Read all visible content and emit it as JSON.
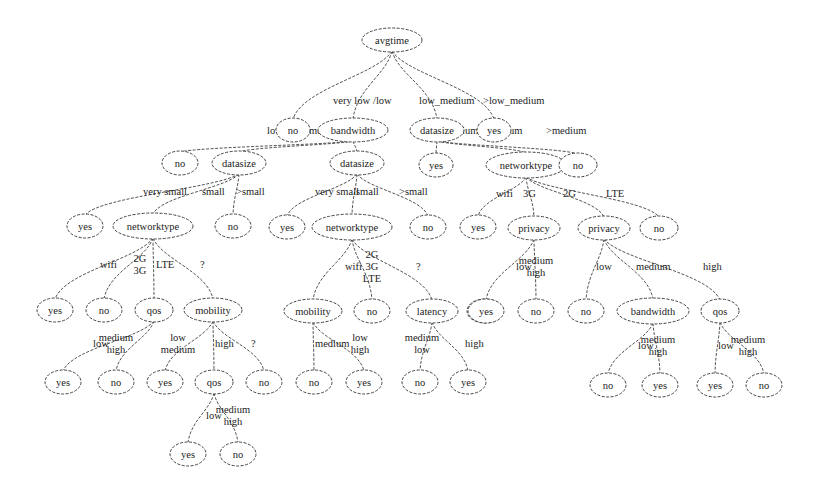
{
  "diagram": {
    "type": "decision-tree",
    "root_attribute": "avgtime",
    "colors": {
      "background": "#ffffff",
      "stroke": "#444444",
      "text": "#222222"
    },
    "nodes": [
      {
        "id": "n0",
        "label": "avgtime",
        "x": 392,
        "y": 40,
        "rx": 30,
        "ry": 12
      },
      {
        "id": "n1",
        "label": "no",
        "x": 293,
        "y": 130,
        "rx": 17,
        "ry": 12
      },
      {
        "id": "n2",
        "label": "bandwidth",
        "x": 353,
        "y": 130,
        "rx": 35,
        "ry": 12
      },
      {
        "id": "n3",
        "label": "datasize",
        "x": 437,
        "y": 130,
        "rx": 27,
        "ry": 12
      },
      {
        "id": "n4",
        "label": "yes",
        "x": 494,
        "y": 130,
        "rx": 17,
        "ry": 12
      },
      {
        "id": "n5",
        "label": "no",
        "x": 180,
        "y": 163,
        "rx": 18,
        "ry": 12
      },
      {
        "id": "n6",
        "label": "datasize",
        "x": 239,
        "y": 163,
        "rx": 27,
        "ry": 12
      },
      {
        "id": "n7",
        "label": "datasize",
        "x": 357,
        "y": 163,
        "rx": 27,
        "ry": 12
      },
      {
        "id": "n8",
        "label": "yes",
        "x": 436,
        "y": 165,
        "rx": 17,
        "ry": 12
      },
      {
        "id": "n9",
        "label": "networktype",
        "x": 526,
        "y": 165,
        "rx": 40,
        "ry": 13
      },
      {
        "id": "n10",
        "label": "no",
        "x": 578,
        "y": 165,
        "rx": 19,
        "ry": 12
      },
      {
        "id": "n11",
        "label": "yes",
        "x": 85,
        "y": 226,
        "rx": 18,
        "ry": 12
      },
      {
        "id": "n12",
        "label": "networktype",
        "x": 153,
        "y": 226,
        "rx": 40,
        "ry": 13
      },
      {
        "id": "n13",
        "label": "no",
        "x": 233,
        "y": 226,
        "rx": 18,
        "ry": 12
      },
      {
        "id": "n14",
        "label": "yes",
        "x": 287,
        "y": 227,
        "rx": 18,
        "ry": 12
      },
      {
        "id": "n15",
        "label": "networktype",
        "x": 352,
        "y": 227,
        "rx": 40,
        "ry": 13
      },
      {
        "id": "n16",
        "label": "no",
        "x": 428,
        "y": 227,
        "rx": 18,
        "ry": 12
      },
      {
        "id": "n17",
        "label": "yes",
        "x": 478,
        "y": 227,
        "rx": 18,
        "ry": 12
      },
      {
        "id": "n18",
        "label": "privacy",
        "x": 534,
        "y": 228,
        "rx": 26,
        "ry": 12
      },
      {
        "id": "n19",
        "label": "privacy",
        "x": 604,
        "y": 228,
        "rx": 26,
        "ry": 12
      },
      {
        "id": "n20",
        "label": "no",
        "x": 659,
        "y": 228,
        "rx": 19,
        "ry": 12
      },
      {
        "id": "n21",
        "label": "yes",
        "x": 55,
        "y": 310,
        "rx": 18,
        "ry": 12
      },
      {
        "id": "n22",
        "label": "no",
        "x": 104,
        "y": 310,
        "rx": 18,
        "ry": 12
      },
      {
        "id": "n23",
        "label": "qos",
        "x": 154,
        "y": 310,
        "rx": 19,
        "ry": 12
      },
      {
        "id": "n24",
        "label": "mobility",
        "x": 213,
        "y": 310,
        "rx": 29,
        "ry": 12
      },
      {
        "id": "n25",
        "label": "mobility",
        "x": 313,
        "y": 311,
        "rx": 29,
        "ry": 12
      },
      {
        "id": "n26",
        "label": "no",
        "x": 372,
        "y": 311,
        "rx": 18,
        "ry": 12
      },
      {
        "id": "n27",
        "label": "latency",
        "x": 432,
        "y": 311,
        "rx": 26,
        "ry": 12
      },
      {
        "id": "n28",
        "label": "yes",
        "x": 485,
        "y": 311,
        "rx": 18,
        "ry": 12
      },
      {
        "id": "n29",
        "label": "yes",
        "x": 486,
        "y": 311,
        "rx": 0,
        "ry": 0,
        "hidden": true
      },
      {
        "id": "n30",
        "label": "yes",
        "x": 485,
        "y": 311,
        "rx": 0,
        "ry": 0,
        "hidden": true
      },
      {
        "id": "n31",
        "label": "yes",
        "x": 486,
        "y": 311,
        "rx": 0,
        "ry": 0,
        "hidden": true
      },
      {
        "id": "n32",
        "label": "yes",
        "x": 485,
        "y": 311,
        "rx": 0,
        "ry": 0,
        "hidden": true
      },
      {
        "id": "p1",
        "label": "yes",
        "x": 486,
        "y": 311,
        "rx": 18,
        "ry": 12
      },
      {
        "id": "p2",
        "label": "no",
        "x": 536,
        "y": 311,
        "rx": 18,
        "ry": 12
      },
      {
        "id": "p3",
        "label": "no",
        "x": 586,
        "y": 311,
        "rx": 18,
        "ry": 12
      },
      {
        "id": "p4",
        "label": "bandwidth",
        "x": 653,
        "y": 311,
        "rx": 36,
        "ry": 13
      },
      {
        "id": "p5",
        "label": "qos",
        "x": 720,
        "y": 311,
        "rx": 19,
        "ry": 12
      },
      {
        "id": "q1",
        "label": "yes",
        "x": 63,
        "y": 382,
        "rx": 18,
        "ry": 12
      },
      {
        "id": "q2",
        "label": "no",
        "x": 116,
        "y": 382,
        "rx": 18,
        "ry": 12
      },
      {
        "id": "q3",
        "label": "yes",
        "x": 165,
        "y": 382,
        "rx": 18,
        "ry": 12
      },
      {
        "id": "q4",
        "label": "qos",
        "x": 214,
        "y": 382,
        "rx": 19,
        "ry": 12
      },
      {
        "id": "q5",
        "label": "no",
        "x": 264,
        "y": 382,
        "rx": 18,
        "ry": 12
      },
      {
        "id": "q6",
        "label": "no",
        "x": 314,
        "y": 382,
        "rx": 18,
        "ry": 12
      },
      {
        "id": "q7",
        "label": "yes",
        "x": 364,
        "y": 382,
        "rx": 18,
        "ry": 12
      },
      {
        "id": "q8",
        "label": "no",
        "x": 420,
        "y": 382,
        "rx": 18,
        "ry": 12
      },
      {
        "id": "q9",
        "label": "yes",
        "x": 468,
        "y": 382,
        "rx": 18,
        "ry": 12
      },
      {
        "id": "q10",
        "label": "no",
        "x": 608,
        "y": 385,
        "rx": 18,
        "ry": 12
      },
      {
        "id": "q11",
        "label": "yes",
        "x": 660,
        "y": 385,
        "rx": 18,
        "ry": 12
      },
      {
        "id": "q12",
        "label": "yes",
        "x": 715,
        "y": 385,
        "rx": 18,
        "ry": 12
      },
      {
        "id": "q13",
        "label": "no",
        "x": 764,
        "y": 385,
        "rx": 18,
        "ry": 12
      },
      {
        "id": "r1",
        "label": "yes",
        "x": 188,
        "y": 454,
        "rx": 18,
        "ry": 12
      },
      {
        "id": "r2",
        "label": "no",
        "x": 238,
        "y": 454,
        "rx": 18,
        "ry": 12
      }
    ],
    "edges": [
      {
        "from": "n0",
        "to": "n1",
        "label": "very low",
        "lx": 333,
        "ly": 104
      },
      {
        "from": "n0",
        "to": "n2",
        "label": "/low",
        "lx": 373,
        "ly": 104
      },
      {
        "from": "n0",
        "to": "n3",
        "label": "low_medium",
        "lx": 419,
        "ly": 104
      },
      {
        "from": "n0",
        "to": "n4",
        "label": ">low_medium",
        "lx": 483,
        "ly": 104
      },
      {
        "from": "n2",
        "to": "n5",
        "label": "low",
        "lx": 267,
        "ly": 134
      },
      {
        "from": "n2",
        "to": "n6",
        "label": "medium",
        "lx": 309,
        "ly": 134
      },
      {
        "from": "n2",
        "to": "n7",
        "label": "high",
        "lx": 357,
        "ly": 134
      },
      {
        "from": "n3",
        "to": "n8",
        "label": "<medium",
        "lx": 438,
        "ly": 134
      },
      {
        "from": "n3",
        "to": "n9",
        "label": "medium",
        "lx": 488,
        "ly": 134
      },
      {
        "from": "n3",
        "to": "n10",
        "label": ">medium",
        "lx": 546,
        "ly": 134
      },
      {
        "from": "n6",
        "to": "n11",
        "label": "very small",
        "lx": 143,
        "ly": 195
      },
      {
        "from": "n6",
        "to": "n12",
        "label": "small",
        "lx": 202,
        "ly": 195
      },
      {
        "from": "n6",
        "to": "n13",
        "label": ">small",
        "lx": 236,
        "ly": 195
      },
      {
        "from": "n7",
        "to": "n14",
        "label": "very small",
        "lx": 315,
        "ly": 195
      },
      {
        "from": "n7",
        "to": "n15",
        "label": "small",
        "lx": 356,
        "ly": 195
      },
      {
        "from": "n7",
        "to": "n16",
        "label": ">small",
        "lx": 399,
        "ly": 195
      },
      {
        "from": "n9",
        "to": "n17",
        "label": "wifi",
        "lx": 496,
        "ly": 197
      },
      {
        "from": "n9",
        "to": "n18",
        "label": "3G",
        "lx": 523,
        "ly": 197
      },
      {
        "from": "n9",
        "to": "n19",
        "label": "2G",
        "lx": 563,
        "ly": 197
      },
      {
        "from": "n9",
        "to": "n20",
        "label": "LTE",
        "lx": 606,
        "ly": 197
      },
      {
        "from": "n12",
        "to": "n21",
        "label": "wifi",
        "lx": 100,
        "ly": 268
      },
      {
        "from": "n12",
        "to": "n22",
        "label": "2G\n3G",
        "lx": 140,
        "ly": 262
      },
      {
        "from": "n12",
        "to": "n23",
        "label": "LTE",
        "lx": 156,
        "ly": 268
      },
      {
        "from": "n12",
        "to": "n24",
        "label": "?",
        "lx": 200,
        "ly": 268
      },
      {
        "from": "n15",
        "to": "n25",
        "label": "wifi",
        "lx": 345,
        "ly": 270
      },
      {
        "from": "n15",
        "to": "n26",
        "label": "2G\n3G\nLTE",
        "lx": 372,
        "ly": 258
      },
      {
        "from": "n15",
        "to": "n27",
        "label": "?",
        "lx": 416,
        "ly": 270
      },
      {
        "from": "n18",
        "to": "p1",
        "label": "low",
        "lx": 516,
        "ly": 270
      },
      {
        "from": "n18",
        "to": "p2",
        "label": "medium\nhigh",
        "lx": 536,
        "ly": 264
      },
      {
        "from": "n19",
        "to": "p3",
        "label": "low",
        "lx": 596,
        "ly": 270
      },
      {
        "from": "n19",
        "to": "p4",
        "label": "medium",
        "lx": 636,
        "ly": 270
      },
      {
        "from": "n19",
        "to": "p5",
        "label": "high",
        "lx": 703,
        "ly": 270
      },
      {
        "from": "n23",
        "to": "q1",
        "label": "low",
        "lx": 93,
        "ly": 347
      },
      {
        "from": "n23",
        "to": "q2",
        "label": "medium\nhigh",
        "lx": 116,
        "ly": 341
      },
      {
        "from": "n24",
        "to": "q3",
        "label": "low\nmedium",
        "lx": 178,
        "ly": 341
      },
      {
        "from": "n24",
        "to": "q4",
        "label": "high",
        "lx": 215,
        "ly": 347
      },
      {
        "from": "n24",
        "to": "q5",
        "label": "?",
        "lx": 251,
        "ly": 347
      },
      {
        "from": "n25",
        "to": "q6",
        "label": "medium",
        "lx": 315,
        "ly": 347
      },
      {
        "from": "n25",
        "to": "q7",
        "label": "low\nhigh",
        "lx": 360,
        "ly": 341
      },
      {
        "from": "n27",
        "to": "q8",
        "label": "medium\nlow",
        "lx": 422,
        "ly": 341
      },
      {
        "from": "n27",
        "to": "q9",
        "label": "high",
        "lx": 465,
        "ly": 347
      },
      {
        "from": "p4",
        "to": "q10",
        "label": "low",
        "lx": 638,
        "ly": 349
      },
      {
        "from": "p4",
        "to": "q11",
        "label": "medium\nhigh",
        "lx": 658,
        "ly": 343
      },
      {
        "from": "p5",
        "to": "q12",
        "label": "low",
        "lx": 718,
        "ly": 349
      },
      {
        "from": "p5",
        "to": "q13",
        "label": "medium\nhigh",
        "lx": 748,
        "ly": 343
      },
      {
        "from": "q4",
        "to": "r1",
        "label": "low",
        "lx": 206,
        "ly": 419
      },
      {
        "from": "q4",
        "to": "r2",
        "label": "medium\nhigh",
        "lx": 233,
        "ly": 413
      }
    ]
  }
}
